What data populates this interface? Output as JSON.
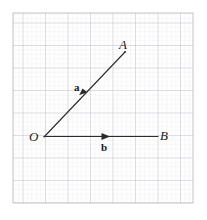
{
  "figure": {
    "type": "vector-diagram",
    "background_color": "#ffffff",
    "width": 207,
    "height": 220
  },
  "grid": {
    "label": "graph-paper-grid",
    "minor_spacing_px": 4.5,
    "major_every": 5,
    "minor_color": "#e3e3ea",
    "major_color": "#b9b9c6",
    "x_start": 13,
    "y_start": 13,
    "x_end": 193,
    "y_end": 203
  },
  "points": [
    {
      "name": "O",
      "label": "O",
      "x": 44,
      "y": 137,
      "label_x": 29,
      "label_y": 131
    },
    {
      "name": "A",
      "label": "A",
      "x": 125,
      "y": 52,
      "label_x": 120,
      "label_y": 39
    },
    {
      "name": "B",
      "label": "B",
      "x": 158,
      "y": 136,
      "label_x": 160,
      "label_y": 130
    }
  ],
  "vectors": [
    {
      "name": "vector-a",
      "label": "a",
      "from": "O",
      "to": "A",
      "label_x": 75,
      "label_y": 83,
      "color": "#2b2b2b",
      "arrow_at_px": 0.5
    },
    {
      "name": "vector-b",
      "label": "b",
      "from": "O",
      "to": "B",
      "label_x": 101,
      "label_y": 143,
      "color": "#2b2b2b",
      "arrow_at_px": 0.55
    }
  ],
  "line_color": "#2b2b2b"
}
